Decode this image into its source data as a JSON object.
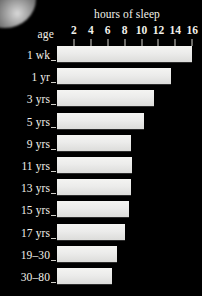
{
  "chart_data": {
    "type": "bar",
    "title": "hours of sleep",
    "xlabel": "hours of sleep",
    "ylabel": "age",
    "orientation": "horizontal",
    "xlim": [
      0,
      17
    ],
    "grid": false,
    "legend": "none",
    "tick_labels": [
      "2",
      "4",
      "6",
      "8",
      "10",
      "12",
      "14",
      "16"
    ],
    "ticks": [
      2,
      4,
      6,
      8,
      10,
      12,
      14,
      16
    ],
    "categories": [
      "1 wk",
      "1 yr",
      "3 yrs",
      "5 yrs",
      "9 yrs",
      "11 yrs",
      "13 yrs",
      "15 yrs",
      "17 yrs",
      "19–30",
      "30–80"
    ],
    "values": [
      16.0,
      13.5,
      11.5,
      10.3,
      8.8,
      8.9,
      8.7,
      8.5,
      8.0,
      7.1,
      6.5
    ]
  },
  "axis": {
    "title": "hours of sleep",
    "category_axis_label": "age"
  },
  "colors": {
    "background": "#000000",
    "bar_fill": "#ececeb",
    "text": "#f2f0ea",
    "tick": "#d8d6d0"
  },
  "icons": {
    "corner_glow": "corner-glow-artifact"
  }
}
